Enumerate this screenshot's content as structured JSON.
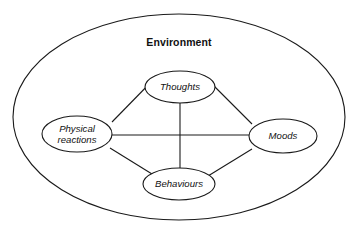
{
  "diagram": {
    "type": "concept-map",
    "title": "Environment",
    "container": {
      "label": "Environment",
      "shape": "ellipse",
      "label_position": "top-inside",
      "center_x": 179,
      "center_y": 117,
      "radius_x": 166,
      "radius_y": 103
    },
    "nodes": [
      {
        "id": "thoughts",
        "label": "Thoughts",
        "lines": [
          "Thoughts"
        ],
        "shape": "ellipse",
        "position": "top",
        "center_x": 180,
        "center_y": 87,
        "radius_x": 35,
        "radius_y": 16
      },
      {
        "id": "physical-reactions",
        "label": "Physical reactions",
        "lines": [
          "Physical",
          "reactions"
        ],
        "shape": "ellipse",
        "position": "left",
        "center_x": 77,
        "center_y": 134,
        "radius_x": 35,
        "radius_y": 18
      },
      {
        "id": "moods",
        "label": "Moods",
        "lines": [
          "Moods"
        ],
        "shape": "ellipse",
        "position": "right",
        "center_x": 283,
        "center_y": 136,
        "radius_x": 34,
        "radius_y": 17
      },
      {
        "id": "behaviours",
        "label": "Behaviours",
        "lines": [
          "Behaviours"
        ],
        "shape": "ellipse",
        "position": "bottom",
        "center_x": 179,
        "center_y": 184,
        "radius_x": 36,
        "radius_y": 16
      }
    ],
    "links": [
      {
        "id": "thoughts-physical",
        "from": "thoughts",
        "to": "physical-reactions",
        "style": "solid",
        "arrow": "none"
      },
      {
        "id": "thoughts-moods",
        "from": "thoughts",
        "to": "moods",
        "style": "solid",
        "arrow": "none"
      },
      {
        "id": "thoughts-behaviours",
        "from": "thoughts",
        "to": "behaviours",
        "style": "solid",
        "arrow": "none"
      },
      {
        "id": "physical-moods",
        "from": "physical-reactions",
        "to": "moods",
        "style": "solid",
        "arrow": "none"
      },
      {
        "id": "physical-behaviours",
        "from": "physical-reactions",
        "to": "behaviours",
        "style": "solid",
        "arrow": "none"
      },
      {
        "id": "moods-behaviours",
        "from": "moods",
        "to": "behaviours",
        "style": "solid",
        "arrow": "none"
      }
    ],
    "colors": {
      "stroke": "#1a1a1a",
      "fill": "#ffffff",
      "text": "#111111",
      "background": "#ffffff"
    },
    "title_x": 179,
    "title_y": 46
  }
}
